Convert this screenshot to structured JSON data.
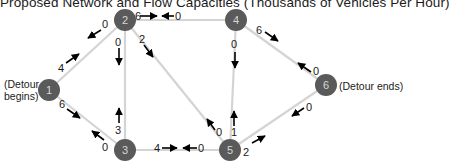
{
  "title": "Proposed Network and Flow Capacities (Thousands of Vehicles Per Hour)",
  "labels": {
    "start": "(Detour\nbegins)",
    "start_line1": "(Detour",
    "start_line2": "begins)",
    "end": "(Detour ends)"
  },
  "colors": {
    "node_fill": "#5a5a5a",
    "node_text": "#d8d8d8",
    "edge": "#d4d4d4",
    "arrow": "#000000",
    "text": "#1a1a1a"
  },
  "nodes": [
    {
      "id": "1",
      "label": "1",
      "x": 49,
      "y": 90
    },
    {
      "id": "2",
      "label": "2",
      "x": 125,
      "y": 20
    },
    {
      "id": "3",
      "label": "3",
      "x": 125,
      "y": 150
    },
    {
      "id": "4",
      "label": "4",
      "x": 236,
      "y": 20
    },
    {
      "id": "5",
      "label": "5",
      "x": 230,
      "y": 150
    },
    {
      "id": "6",
      "label": "6",
      "x": 326,
      "y": 85
    }
  ],
  "edges": [
    {
      "from": "1",
      "to": "2",
      "capacity_forward": "4",
      "capacity_backward": "0"
    },
    {
      "from": "1",
      "to": "3",
      "capacity_forward": "6",
      "capacity_backward": "0"
    },
    {
      "from": "2",
      "to": "4",
      "capacity_forward": "6",
      "capacity_backward": "0"
    },
    {
      "from": "2",
      "to": "3",
      "capacity_forward": "0",
      "capacity_backward": "3"
    },
    {
      "from": "2",
      "to": "5",
      "capacity_forward": "2",
      "capacity_backward": "0"
    },
    {
      "from": "4",
      "to": "5",
      "capacity_forward": "0",
      "capacity_backward": "1"
    },
    {
      "from": "4",
      "to": "6",
      "capacity_forward": "6",
      "capacity_backward": "0"
    },
    {
      "from": "3",
      "to": "5",
      "capacity_forward": "4",
      "capacity_backward": "0"
    },
    {
      "from": "5",
      "to": "6",
      "capacity_forward": "2",
      "capacity_backward": "0"
    }
  ],
  "flow_labels": {
    "e12_fwd": "4",
    "e12_bwd": "0",
    "e13_fwd": "6",
    "e13_bwd": "0",
    "e24_fwd": "6",
    "e24_bwd": "0",
    "e23_fwd": "0",
    "e23_bwd": "3",
    "e25_fwd": "2",
    "e25_bwd": "0",
    "e45_fwd": "0",
    "e45_bwd": "1",
    "e46_fwd": "6",
    "e46_bwd": "0",
    "e35_fwd": "4",
    "e35_bwd": "0",
    "e56_fwd": "2",
    "e56_bwd": "0"
  }
}
